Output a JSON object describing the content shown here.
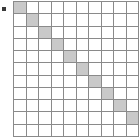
{
  "figure": {
    "type": "matrix-diagram",
    "bullet_marker": "square-bullet",
    "colors": {
      "grid_line": "#8a8a8a",
      "cell_empty": "#ffffff",
      "cell_filled": "#c9c9c9",
      "bullet": "#3a3a3a",
      "background": "#ffffff"
    }
  },
  "chart_data": {
    "type": "heatmap",
    "title": "",
    "xlabel": "",
    "ylabel": "",
    "rows": 11,
    "columns": 10,
    "grid": true,
    "legend": "none",
    "note": "Identity-like diagonal: cell (r, c) is shaded where r == c for r = 0..9; final row 10 is entirely empty.",
    "values": [
      [
        1,
        0,
        0,
        0,
        0,
        0,
        0,
        0,
        0,
        0
      ],
      [
        0,
        1,
        0,
        0,
        0,
        0,
        0,
        0,
        0,
        0
      ],
      [
        0,
        0,
        1,
        0,
        0,
        0,
        0,
        0,
        0,
        0
      ],
      [
        0,
        0,
        0,
        1,
        0,
        0,
        0,
        0,
        0,
        0
      ],
      [
        0,
        0,
        0,
        0,
        1,
        0,
        0,
        0,
        0,
        0
      ],
      [
        0,
        0,
        0,
        0,
        0,
        1,
        0,
        0,
        0,
        0
      ],
      [
        0,
        0,
        0,
        0,
        0,
        0,
        1,
        0,
        0,
        0
      ],
      [
        0,
        0,
        0,
        0,
        0,
        0,
        0,
        1,
        0,
        0
      ],
      [
        0,
        0,
        0,
        0,
        0,
        0,
        0,
        0,
        1,
        0
      ],
      [
        0,
        0,
        0,
        0,
        0,
        0,
        0,
        0,
        0,
        1
      ],
      [
        0,
        0,
        0,
        0,
        0,
        0,
        0,
        0,
        0,
        0
      ]
    ]
  }
}
